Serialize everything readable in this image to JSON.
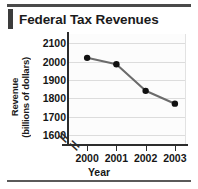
{
  "figure": {
    "title": "Federal Tax Revenues",
    "xlabel": "Year",
    "ylabel_line1": "Revenue",
    "ylabel_line2": "(billions of dollars)",
    "accent_color": "#3c3c3c",
    "rule_color": "#4a4a4a",
    "marker_color": "#111111",
    "line_color": "#6b6b6b",
    "grid_color": "#dcdcdc",
    "axis_color": "#2c2c2c",
    "plot_background": "#fcfcfc",
    "axis_break_symbol": "//"
  },
  "chart_data": {
    "type": "line",
    "title": "Federal Tax Revenues",
    "xlabel": "Year",
    "ylabel": "Revenue (billions of dollars)",
    "categories": [
      "2000",
      "2001",
      "2002",
      "2003"
    ],
    "x": [
      2000,
      2001,
      2002,
      2003
    ],
    "values": [
      2020,
      1985,
      1840,
      1770
    ],
    "series": [
      {
        "name": "Federal Tax Revenues",
        "values": [
          2020,
          1985,
          1840,
          1770
        ]
      }
    ],
    "ylim": [
      1550,
      2150
    ],
    "yticks": [
      1600,
      1700,
      1800,
      1900,
      2000,
      2100
    ],
    "ytick_labels": [
      "1600",
      "1700",
      "1800",
      "1900",
      "2000",
      "2100"
    ],
    "xticks": [
      2000,
      2001,
      2002,
      2003
    ],
    "xtick_labels": [
      "2000",
      "2001",
      "2002",
      "2003"
    ],
    "grid": true,
    "grid_axis": "y",
    "legend": false,
    "y_axis_break": true,
    "x_axis_break": true,
    "markers": "filled-circle"
  }
}
